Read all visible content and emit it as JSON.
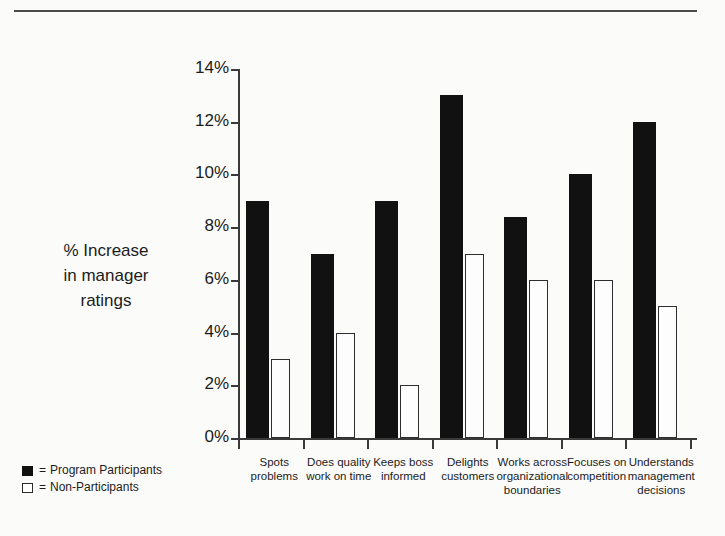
{
  "chart_data": {
    "type": "bar",
    "title": "",
    "xlabel": "",
    "ylabel": "% Increase in manager ratings",
    "ylim": [
      0,
      14
    ],
    "ytick_labels": [
      "0%",
      "2%",
      "4%",
      "6%",
      "8%",
      "10%",
      "12%",
      "14%"
    ],
    "ytick_values": [
      0,
      2,
      4,
      6,
      8,
      10,
      12,
      14
    ],
    "grid": false,
    "legend_position": "bottom-left",
    "categories": [
      "Spots problems",
      "Does quality work on time",
      "Keeps boss informed",
      "Delights customers",
      "Works across organizational boundaries",
      "Focuses on competition",
      "Understands management decisions"
    ],
    "category_lines": [
      [
        "Spots",
        "problems"
      ],
      [
        "Does quality",
        "work on time"
      ],
      [
        "Keeps boss",
        "informed"
      ],
      [
        "Delights",
        "customers"
      ],
      [
        "Works across",
        "organizational",
        "boundaries"
      ],
      [
        "Focuses on",
        "competition"
      ],
      [
        "Understands",
        "management",
        "decisions"
      ]
    ],
    "series": [
      {
        "name": "Program Participants",
        "color": "#111111",
        "values": [
          9,
          7,
          9,
          13,
          8.4,
          10,
          12
        ]
      },
      {
        "name": "Non-Participants",
        "color": "#ffffff",
        "values": [
          3,
          4,
          2,
          7,
          6,
          6,
          5
        ]
      }
    ]
  },
  "axis_title": {
    "line1": "% Increase",
    "line2": "in manager",
    "line3": "ratings"
  },
  "legend": {
    "equals": "=",
    "items": [
      {
        "label": "Program Participants",
        "swatch": "dark"
      },
      {
        "label": "Non-Participants",
        "swatch": "light"
      }
    ]
  }
}
